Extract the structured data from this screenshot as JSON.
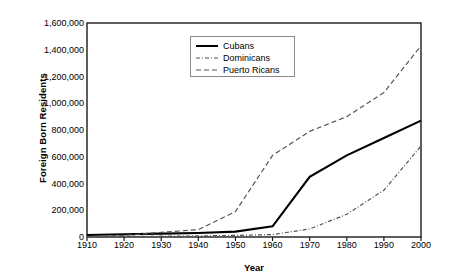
{
  "chart_data": {
    "type": "line",
    "title": "",
    "xlabel": "Year",
    "ylabel": "Foreign Born Residents",
    "x": [
      1910,
      1920,
      1930,
      1940,
      1950,
      1960,
      1970,
      1980,
      1990,
      2000
    ],
    "xlim": [
      1910,
      2000
    ],
    "ylim": [
      0,
      1600000
    ],
    "xticks": [
      "1910",
      "1920",
      "1930",
      "1940",
      "1950",
      "1960",
      "1970",
      "1980",
      "1990",
      "2000"
    ],
    "yticks": [
      "0",
      "200,000",
      "400,000",
      "600,000",
      "800,000",
      "1,000,000",
      "1,200,000",
      "1,400,000",
      "1,600,000"
    ],
    "ytick_values": [
      0,
      200000,
      400000,
      600000,
      800000,
      1000000,
      1200000,
      1400000,
      1600000
    ],
    "grid": false,
    "legend_position": "top-center",
    "series": [
      {
        "name": "Cubans",
        "style": "solid",
        "color": "#000000",
        "values": [
          15000,
          20000,
          25000,
          30000,
          40000,
          80000,
          450000,
          610000,
          740000,
          870000
        ]
      },
      {
        "name": "Dominicans",
        "style": "dash-dot",
        "color": "#555555",
        "values": [
          3000,
          4000,
          6000,
          8000,
          12000,
          18000,
          60000,
          170000,
          350000,
          680000
        ]
      },
      {
        "name": "Puerto Ricans",
        "style": "dashed",
        "color": "#555555",
        "values": [
          2000,
          12000,
          35000,
          55000,
          190000,
          610000,
          790000,
          900000,
          1080000,
          1430000
        ]
      }
    ]
  },
  "legend": {
    "entries": [
      {
        "label": "Cubans"
      },
      {
        "label": "Dominicans"
      },
      {
        "label": "Puerto Ricans"
      }
    ]
  }
}
